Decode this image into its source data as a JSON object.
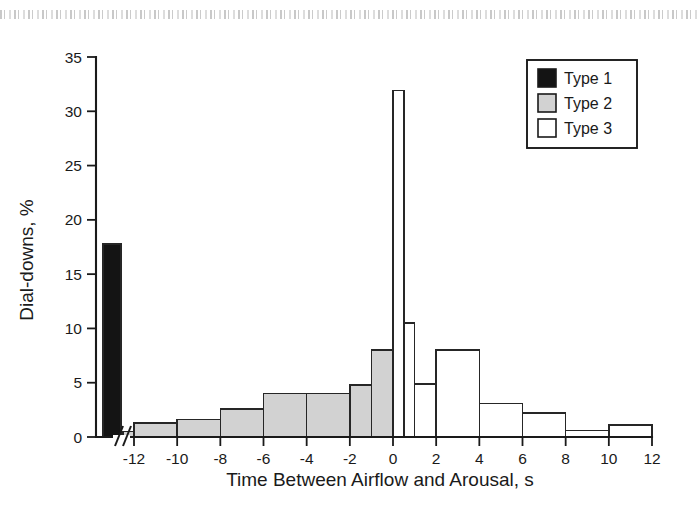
{
  "chart_data": {
    "type": "bar",
    "title": "",
    "subtitle": "",
    "xlabel": "Time Between Airflow and Arousal, s",
    "ylabel": "Dial-downs, %",
    "xlim": [
      -13.5,
      12
    ],
    "ylim": [
      0,
      35
    ],
    "grid": false,
    "axis_break": {
      "symbol": "//",
      "after_x": -13.0,
      "note": "x-axis break between the Type 1 bar and the -12 tick"
    },
    "x_ticks": [
      -12,
      -10,
      -8,
      -6,
      -4,
      -2,
      0,
      2,
      4,
      6,
      8,
      10,
      12
    ],
    "x_tick_labels": [
      "-12",
      "-10",
      "-8",
      "-6",
      "-4",
      "-2",
      "0",
      "2",
      "4",
      "6",
      "8",
      "10",
      "12"
    ],
    "y_ticks": [
      0,
      5,
      10,
      15,
      20,
      25,
      30,
      35
    ],
    "y_tick_labels": [
      "0",
      "5",
      "10",
      "15",
      "20",
      "25",
      "30",
      "35"
    ],
    "legend": {
      "position": "top-right",
      "entries": [
        {
          "name": "Type 1",
          "color": "#141414"
        },
        {
          "name": "Type 2",
          "color": "#d2d2d2"
        },
        {
          "name": "Type 3",
          "color": "#ffffff"
        }
      ]
    },
    "series": [
      {
        "name": "Type 1",
        "color": "#141414",
        "bins": [
          {
            "x0": -13.45,
            "x1": -12.6,
            "value": 17.8
          }
        ]
      },
      {
        "name": "Type 2",
        "color": "#d2d2d2",
        "bins": [
          {
            "x0": -12.5,
            "x1": -12.0,
            "value": 0.5
          },
          {
            "x0": -12.0,
            "x1": -10.0,
            "value": 1.3
          },
          {
            "x0": -10.0,
            "x1": -8.0,
            "value": 1.6
          },
          {
            "x0": -8.0,
            "x1": -6.0,
            "value": 2.6
          },
          {
            "x0": -6.0,
            "x1": -4.0,
            "value": 4.0
          },
          {
            "x0": -4.0,
            "x1": -2.0,
            "value": 4.0
          },
          {
            "x0": -2.0,
            "x1": -1.0,
            "value": 4.8
          },
          {
            "x0": -1.0,
            "x1": 0.0,
            "value": 8.0
          }
        ]
      },
      {
        "name": "Type 3",
        "color": "#ffffff",
        "bins": [
          {
            "x0": 0.0,
            "x1": 0.5,
            "value": 31.9
          },
          {
            "x0": 0.5,
            "x1": 1.0,
            "value": 10.5
          },
          {
            "x0": 1.0,
            "x1": 2.0,
            "value": 4.9
          },
          {
            "x0": 2.0,
            "x1": 4.0,
            "value": 8.0
          },
          {
            "x0": 4.0,
            "x1": 6.0,
            "value": 3.1
          },
          {
            "x0": 6.0,
            "x1": 8.0,
            "value": 2.2
          },
          {
            "x0": 8.0,
            "x1": 10.0,
            "value": 0.6
          },
          {
            "x0": 10.0,
            "x1": 12.0,
            "value": 1.1
          }
        ]
      }
    ]
  }
}
